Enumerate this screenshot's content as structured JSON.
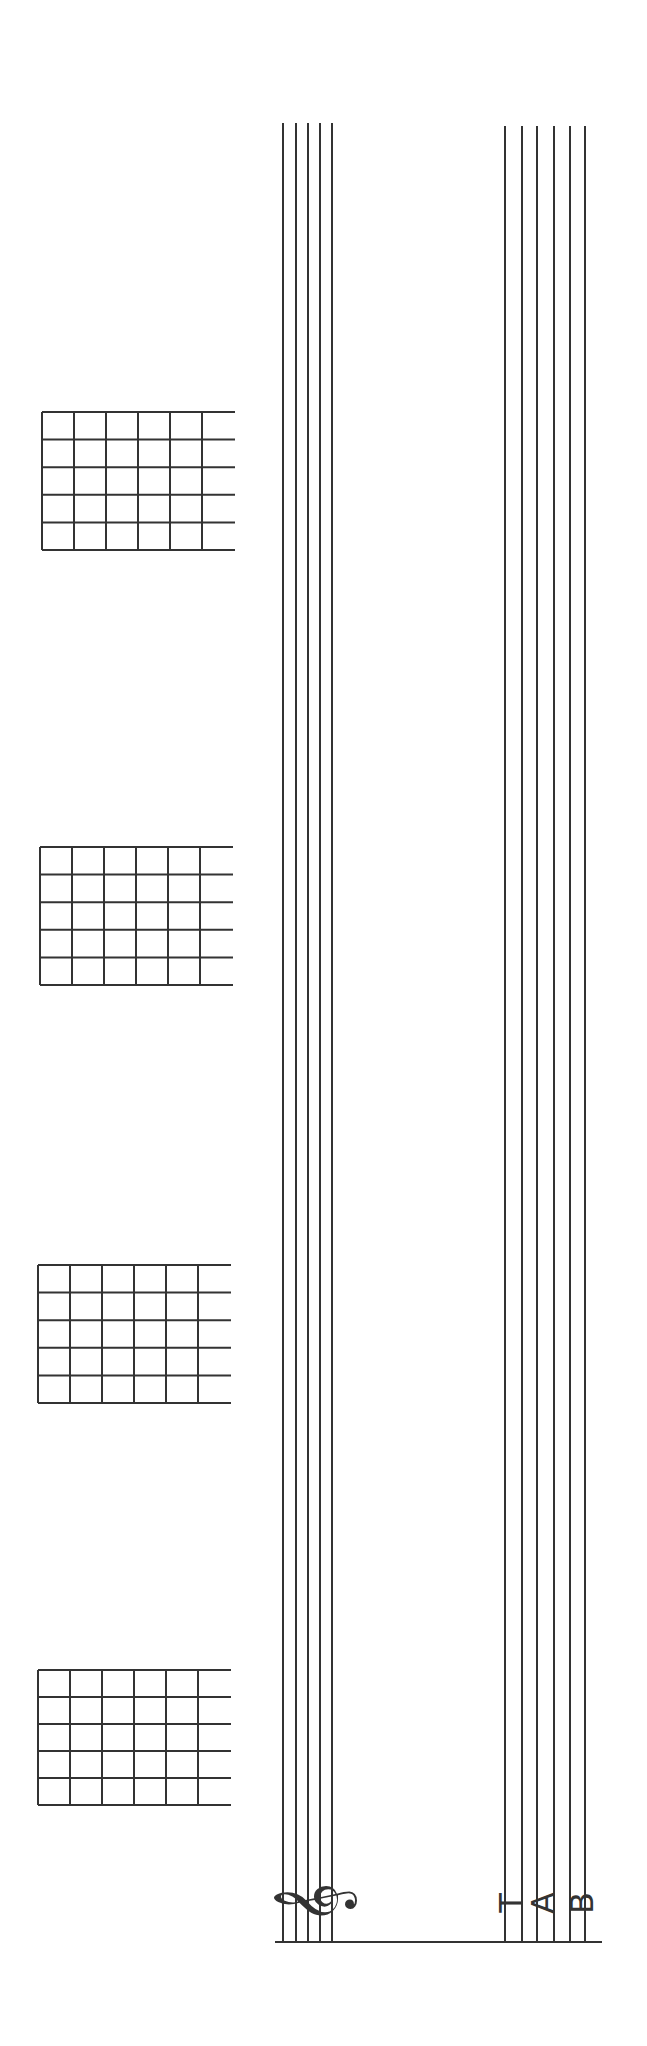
{
  "sheet": {
    "type": "guitar chord + staff + tablature blank sheet (rotated)",
    "colors": {
      "ink": "#333333",
      "background": "#ffffff"
    },
    "chord_grids": [
      {
        "x": 42,
        "y": 412,
        "w": 160,
        "h": 138,
        "ext": 33
      },
      {
        "x": 40,
        "y": 847,
        "w": 160,
        "h": 138,
        "ext": 33
      },
      {
        "x": 38,
        "y": 1265,
        "w": 160,
        "h": 138,
        "ext": 33
      },
      {
        "x": 38,
        "y": 1670,
        "w": 160,
        "h": 135,
        "ext": 33
      }
    ],
    "standard_staff": {
      "lines_x": [
        283,
        296,
        308,
        320,
        332
      ],
      "top": 123,
      "bottom": 1942,
      "clef": "treble-clef"
    },
    "tab_staff": {
      "lines_x": [
        505,
        522,
        537,
        554,
        570,
        585
      ],
      "top": 126,
      "bottom": 1942,
      "label": [
        "T",
        "A",
        "B"
      ]
    },
    "bottom_rule": {
      "x1": 275,
      "x2": 602,
      "y": 1942
    }
  }
}
